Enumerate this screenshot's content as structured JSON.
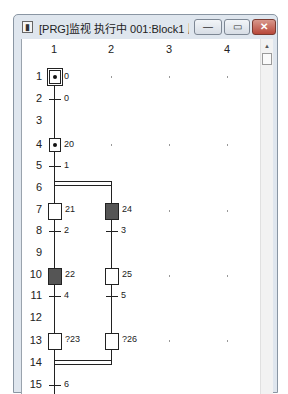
{
  "window": {
    "title": "[PRG]监视 执行中 001:Block1 顺序...",
    "icon": "document-icon",
    "buttons": {
      "minimize": "—",
      "maximize": "▭",
      "close": "✕"
    }
  },
  "grid": {
    "columns": [
      "1",
      "2",
      "3",
      "4"
    ],
    "rows": [
      "1",
      "2",
      "3",
      "4",
      "5",
      "6",
      "7",
      "8",
      "9",
      "10",
      "11",
      "12",
      "13",
      "14",
      "15"
    ]
  },
  "sfc": {
    "steps": [
      {
        "row": 1,
        "col": 1,
        "label": "0",
        "type": "initial",
        "active": true
      },
      {
        "row": 4,
        "col": 1,
        "label": "20",
        "type": "step",
        "active": true
      },
      {
        "row": 7,
        "col": 1,
        "label": "21",
        "type": "step",
        "active": false
      },
      {
        "row": 7,
        "col": 2,
        "label": "24",
        "type": "step",
        "active": true
      },
      {
        "row": 10,
        "col": 1,
        "label": "22",
        "type": "step",
        "active": true
      },
      {
        "row": 10,
        "col": 2,
        "label": "25",
        "type": "step",
        "active": false
      },
      {
        "row": 13,
        "col": 1,
        "label": "?23",
        "type": "step",
        "active": false
      },
      {
        "row": 13,
        "col": 2,
        "label": "?26",
        "type": "step",
        "active": false
      }
    ],
    "transitions": [
      {
        "row": 2,
        "col": 1,
        "label": "0"
      },
      {
        "row": 5,
        "col": 1,
        "label": "1"
      },
      {
        "row": 8,
        "col": 1,
        "label": "2"
      },
      {
        "row": 8,
        "col": 2,
        "label": "3"
      },
      {
        "row": 11,
        "col": 1,
        "label": "4"
      },
      {
        "row": 11,
        "col": 2,
        "label": "5"
      },
      {
        "row": 15,
        "col": 1,
        "label": "6"
      }
    ],
    "labels": {
      "s1": "0",
      "t2": "0",
      "s4": "20",
      "t5": "1",
      "s7a": "21",
      "s7b": "24",
      "t8a": "2",
      "t8b": "3",
      "s10a": "22",
      "s10b": "25",
      "t11a": "4",
      "t11b": "5",
      "s13a": "?23",
      "s13b": "?26",
      "t15": "6"
    },
    "colors": {
      "active_step": "#555555",
      "line": "#222222"
    }
  }
}
